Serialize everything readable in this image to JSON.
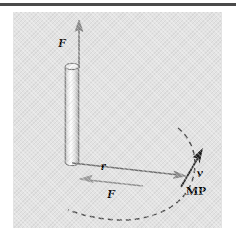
{
  "figure": {
    "background_color": "#e3e3e3",
    "page_background": "#ffffff",
    "rule_color": "#4a4a4a",
    "line_color": "#6b6b6b",
    "dash_color": "#555555",
    "label_color": "#000000"
  },
  "labels": {
    "force_top": "F",
    "force_horizontal": "F",
    "radius": "r",
    "velocity": "v",
    "point": "MP"
  },
  "icons": {
    "rod": "cylinder-rod-icon",
    "arrow_up": "arrow-up-icon",
    "arrow_left": "arrow-left-icon",
    "arrow_right": "arrow-right-icon",
    "arrow_velocity": "arrow-diagonal-icon",
    "arc": "dashed-arc-icon"
  },
  "geometry": {
    "rod_top_y": 62,
    "rod_bottom_y": 163,
    "rod_x": 72,
    "rod_width": 14,
    "force_arrow_tip_y": 22,
    "radius_arrow_start_x": 79,
    "radius_arrow_end_x": 182,
    "radius_arrow_y": 174,
    "mp_x": 183,
    "mp_y": 175,
    "velocity_angle_deg": 58
  }
}
